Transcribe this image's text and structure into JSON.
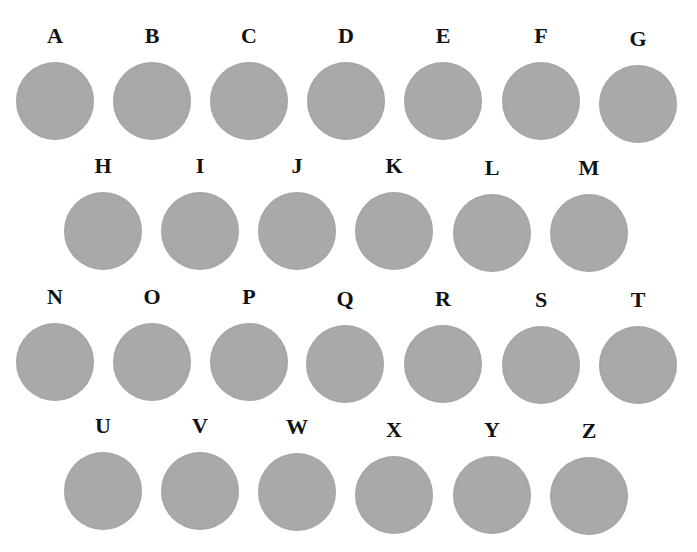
{
  "figure": {
    "circle_color": "#a9a9a9",
    "rows": [
      {
        "items": [
          {
            "label": "A",
            "x": 15,
            "y": 24
          },
          {
            "label": "B",
            "x": 112,
            "y": 24
          },
          {
            "label": "C",
            "x": 209,
            "y": 24
          },
          {
            "label": "D",
            "x": 306,
            "y": 24
          },
          {
            "label": "E",
            "x": 403,
            "y": 24
          },
          {
            "label": "F",
            "x": 501,
            "y": 24
          },
          {
            "label": "G",
            "x": 598,
            "y": 27
          }
        ]
      },
      {
        "items": [
          {
            "label": "H",
            "x": 63,
            "y": 154
          },
          {
            "label": "I",
            "x": 160,
            "y": 154
          },
          {
            "label": "J",
            "x": 257,
            "y": 154
          },
          {
            "label": "K",
            "x": 354,
            "y": 154
          },
          {
            "label": "L",
            "x": 452,
            "y": 156
          },
          {
            "label": "M",
            "x": 549,
            "y": 156
          }
        ]
      },
      {
        "items": [
          {
            "label": "N",
            "x": 15,
            "y": 285
          },
          {
            "label": "O",
            "x": 112,
            "y": 285
          },
          {
            "label": "P",
            "x": 209,
            "y": 285
          },
          {
            "label": "Q",
            "x": 305,
            "y": 287
          },
          {
            "label": "R",
            "x": 403,
            "y": 287
          },
          {
            "label": "S",
            "x": 501,
            "y": 288
          },
          {
            "label": "T",
            "x": 598,
            "y": 288
          }
        ]
      },
      {
        "items": [
          {
            "label": "U",
            "x": 63,
            "y": 414
          },
          {
            "label": "V",
            "x": 160,
            "y": 414
          },
          {
            "label": "W",
            "x": 257,
            "y": 415
          },
          {
            "label": "X",
            "x": 354,
            "y": 418
          },
          {
            "label": "Y",
            "x": 452,
            "y": 418
          },
          {
            "label": "Z",
            "x": 549,
            "y": 419
          }
        ]
      }
    ]
  }
}
